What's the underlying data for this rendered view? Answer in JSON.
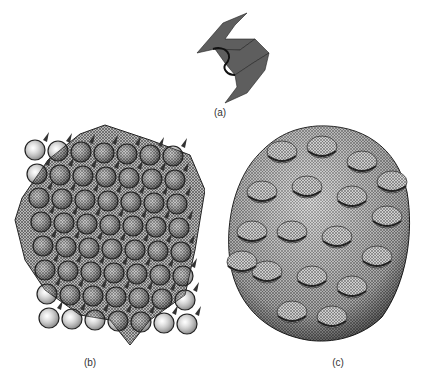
{
  "figure": {
    "panels": [
      {
        "id": "a",
        "label": "(a)",
        "description": "single periodic minimal-surface unit (saddle mesh)"
      },
      {
        "id": "b",
        "label": "(b)",
        "description": "periodic lattice of mesh surface, spiky cubic array"
      },
      {
        "id": "c",
        "label": "(c)",
        "description": "rounded blob-like mesh cluster with lumpy surface"
      }
    ],
    "colors": {
      "mesh_dark": "#2a2a2a",
      "mesh_mid": "#6e6e6e",
      "mesh_light": "#c8c8c8",
      "background": "#ffffff"
    }
  }
}
